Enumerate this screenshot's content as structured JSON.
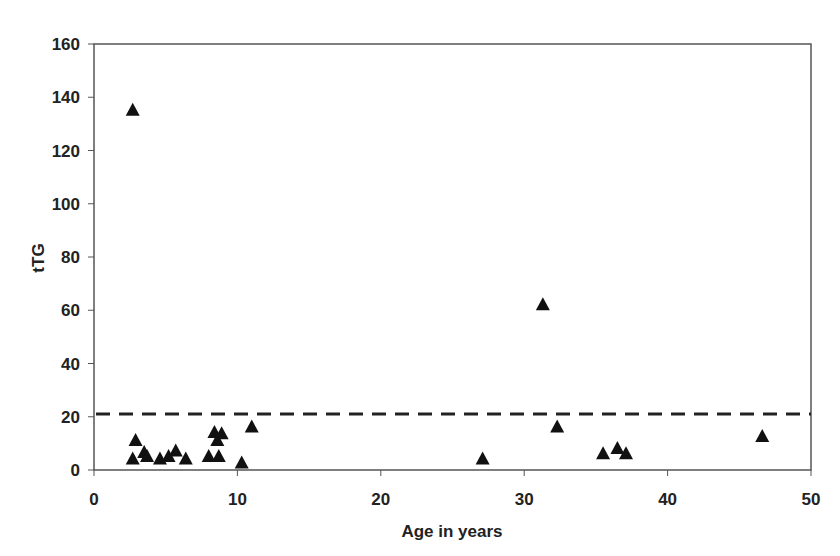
{
  "chart_data": {
    "type": "scatter",
    "title": "",
    "xlabel": "Age in years",
    "ylabel": "tTG",
    "xlim": [
      0,
      50
    ],
    "ylim": [
      0,
      160
    ],
    "x_ticks": [
      0,
      10,
      20,
      30,
      40,
      50
    ],
    "y_ticks": [
      0,
      20,
      40,
      60,
      80,
      100,
      120,
      140,
      160
    ],
    "grid": false,
    "legend": null,
    "marker": "triangle",
    "marker_color": "#111111",
    "reference_line": {
      "y": 21,
      "style": "dashed",
      "color": "#222222"
    },
    "series": [
      {
        "name": "tTG",
        "points": [
          {
            "x": 2.7,
            "y": 135
          },
          {
            "x": 2.9,
            "y": 11
          },
          {
            "x": 2.7,
            "y": 4
          },
          {
            "x": 3.5,
            "y": 6.5
          },
          {
            "x": 3.7,
            "y": 5
          },
          {
            "x": 4.6,
            "y": 4
          },
          {
            "x": 5.2,
            "y": 5
          },
          {
            "x": 5.7,
            "y": 7
          },
          {
            "x": 6.4,
            "y": 4
          },
          {
            "x": 8.0,
            "y": 5
          },
          {
            "x": 8.7,
            "y": 5
          },
          {
            "x": 8.4,
            "y": 14
          },
          {
            "x": 8.9,
            "y": 13.5
          },
          {
            "x": 8.6,
            "y": 11
          },
          {
            "x": 10.3,
            "y": 2.5
          },
          {
            "x": 11.0,
            "y": 16
          },
          {
            "x": 27.1,
            "y": 4
          },
          {
            "x": 31.3,
            "y": 62
          },
          {
            "x": 32.3,
            "y": 16
          },
          {
            "x": 35.5,
            "y": 6
          },
          {
            "x": 36.5,
            "y": 8
          },
          {
            "x": 37.1,
            "y": 6
          },
          {
            "x": 46.6,
            "y": 12.5
          }
        ]
      }
    ]
  }
}
